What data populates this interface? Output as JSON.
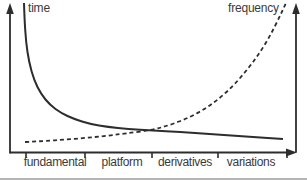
{
  "figure": {
    "background": "#ffffff",
    "stroke_color": "#2d2d2d",
    "label_color": "#3a3a3a",
    "divider_color": "#b5b5b5",
    "y_left_label": "time",
    "y_right_label": "frequency"
  },
  "chart_data": {
    "type": "line",
    "title": "",
    "xlabel": "",
    "ylabel_left": "time",
    "ylabel_right": "frequency",
    "categories": [
      "fundamental",
      "platform",
      "derivatives",
      "variations"
    ],
    "legend": "labels at top of each axis, no legend box",
    "axes": {
      "numeric_ticks": false,
      "grid": false,
      "x_arrow_right": true,
      "y_left_arrow_up": true,
      "y_right_arrow_up": true
    },
    "series": [
      {
        "name": "time",
        "line_style": "solid",
        "axis": "left",
        "shape": "steep hyperbolic decay, flattens to the right",
        "values_at_categories": [
          0.28,
          0.16,
          0.13,
          0.1
        ],
        "pixel_points": [
          [
            24,
            3
          ],
          [
            24.5,
            20
          ],
          [
            26,
            42
          ],
          [
            29,
            62
          ],
          [
            34,
            80
          ],
          [
            41,
            94
          ],
          [
            50,
            105
          ],
          [
            61,
            113
          ],
          [
            74,
            119
          ],
          [
            90,
            124
          ],
          [
            108,
            127
          ],
          [
            128,
            129
          ],
          [
            152,
            130.5
          ],
          [
            180,
            132
          ],
          [
            210,
            134
          ],
          [
            245,
            136.5
          ],
          [
            283,
            139
          ]
        ]
      },
      {
        "name": "frequency",
        "line_style": "dashed",
        "axis": "right",
        "shape": "slow start then exponential growth, crosses time curve near derivatives tick",
        "values_at_categories": [
          0.08,
          0.12,
          0.22,
          0.61
        ],
        "pixel_points": [
          [
            25,
            142
          ],
          [
            45,
            141
          ],
          [
            65,
            139.5
          ],
          [
            85,
            138
          ],
          [
            105,
            136
          ],
          [
            125,
            133.5
          ],
          [
            152,
            130
          ],
          [
            170,
            125
          ],
          [
            188,
            118
          ],
          [
            205,
            109
          ],
          [
            220,
            98
          ],
          [
            234,
            85
          ],
          [
            247,
            70
          ],
          [
            259,
            54
          ],
          [
            270,
            36
          ],
          [
            279,
            18
          ],
          [
            286,
            3
          ]
        ]
      }
    ],
    "crossing_point_px": [
      152,
      130
    ],
    "tick_x": [
      26,
      85,
      152,
      218,
      287
    ],
    "category_label_centers_x": [
      55,
      122,
      185,
      251
    ]
  }
}
